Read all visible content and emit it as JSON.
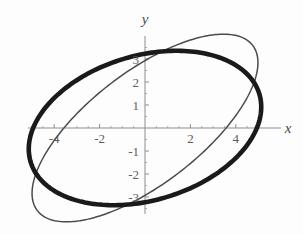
{
  "figure": {
    "background_color": "#fdfdfd",
    "width": 303,
    "height": 234
  },
  "axes": {
    "x_axis_label": "x",
    "y_axis_label": "y",
    "origin_px": {
      "x": 145,
      "y": 128
    },
    "px_per_unit_x": 22.7,
    "px_per_unit_y": 23.0,
    "axis_color": "#8d8d8d",
    "x_tick_labels": [
      "-4",
      "-2",
      "2",
      "4"
    ],
    "x_tick_values": [
      -4,
      -2,
      2,
      4
    ],
    "y_tick_labels": [
      "3",
      "2",
      "1",
      "-1",
      "-2",
      "-3"
    ],
    "y_tick_values": [
      3,
      2,
      1,
      -1,
      -2,
      -3
    ],
    "minor_tick_step": 0.5
  },
  "chart_data": {
    "type": "line",
    "title": "",
    "xlabel": "x",
    "ylabel": "y",
    "xlim": [
      -5.6,
      5.6
    ],
    "ylim": [
      -3.8,
      3.8
    ],
    "grid": false,
    "legend": "none",
    "series": [
      {
        "name": "thick-ellipse",
        "shape": "ellipse",
        "color": "#1a1a1a",
        "line_width": 4.6,
        "center": [
          0,
          0
        ],
        "semi_major": 5.25,
        "semi_minor": 3.15,
        "rotation_deg": 16
      },
      {
        "name": "thin-ellipse",
        "shape": "ellipse",
        "color": "#4b4b4b",
        "line_width": 1.5,
        "center": [
          0,
          0
        ],
        "semi_major": 5.95,
        "semi_minor": 2.45,
        "rotation_deg": 37
      }
    ]
  }
}
